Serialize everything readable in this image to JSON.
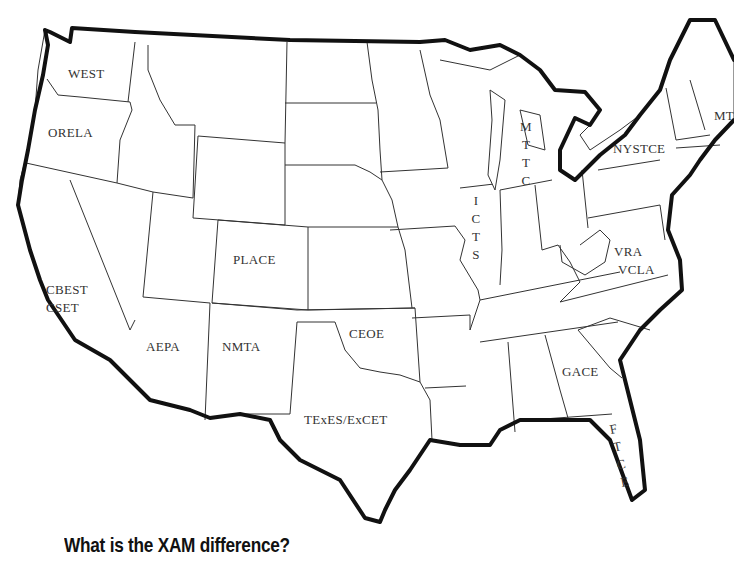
{
  "map": {
    "title": "US teacher certification exams by state",
    "labels": {
      "washington": "WEST",
      "oregon": "ORELA",
      "california_1": "CBEST",
      "california_2": "CSET",
      "arizona": "AEPA",
      "colorado": "PLACE",
      "new_mexico": "NMTA",
      "oklahoma": "CEOE",
      "texas": "TExES/ExCET",
      "illinois": [
        "I",
        "C",
        "T",
        "S"
      ],
      "michigan": [
        "M",
        "T",
        "T",
        "C"
      ],
      "new_york": "NYSTCE",
      "massachusetts": "MT",
      "virginia_1": "VRA",
      "virginia_2": "VCLA",
      "georgia": "GACE",
      "florida": [
        "F",
        "T",
        "C",
        "E"
      ]
    },
    "colors": {
      "background": "#ffffff",
      "state_border": "#333333",
      "coastline": "#111111",
      "label_text": "#333333"
    }
  },
  "caption": "What is the XAM difference?"
}
